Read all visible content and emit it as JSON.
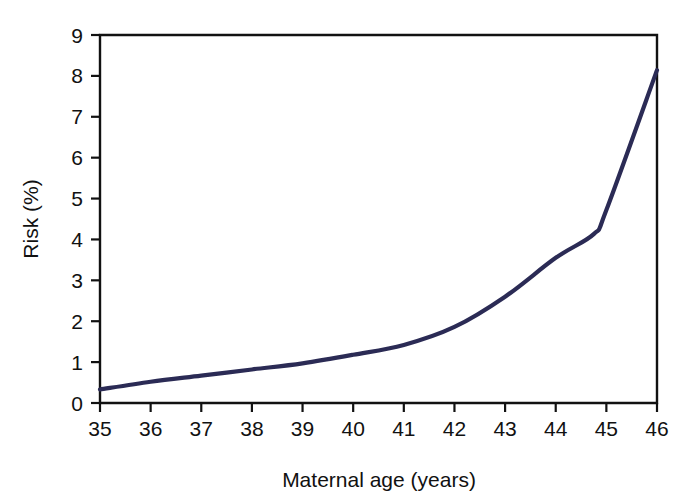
{
  "chart_data": {
    "type": "line",
    "title": "",
    "subtitle": "",
    "xlabel": "Maternal age (years)",
    "ylabel": "Risk (%)",
    "xlim": [
      35,
      46
    ],
    "ylim": [
      0,
      9
    ],
    "grid": false,
    "legend": false,
    "legend_position": "none",
    "x_tick_labels": [
      "35",
      "36",
      "37",
      "38",
      "39",
      "40",
      "41",
      "42",
      "43",
      "44",
      "45",
      "46"
    ],
    "y_tick_labels": [
      "0",
      "1",
      "2",
      "3",
      "4",
      "5",
      "6",
      "7",
      "8",
      "9"
    ],
    "x_ticks": [
      35,
      36,
      37,
      38,
      39,
      40,
      41,
      42,
      43,
      44,
      45,
      46
    ],
    "y_ticks": [
      0,
      1,
      2,
      3,
      4,
      5,
      6,
      7,
      8,
      9
    ],
    "line_color": "#2b2b55",
    "axis_color": "#111111",
    "background_color": "#ffffff",
    "series": [
      {
        "name": "Risk",
        "color": "#2b2b55",
        "x": [
          35,
          36,
          37,
          38,
          39,
          40,
          41,
          42,
          43,
          44,
          44.75,
          45,
          46
        ],
        "values": [
          0.33,
          0.52,
          0.67,
          0.82,
          0.97,
          1.18,
          1.42,
          1.86,
          2.6,
          3.55,
          4.13,
          4.72,
          8.14
        ]
      }
    ],
    "annotations": []
  }
}
